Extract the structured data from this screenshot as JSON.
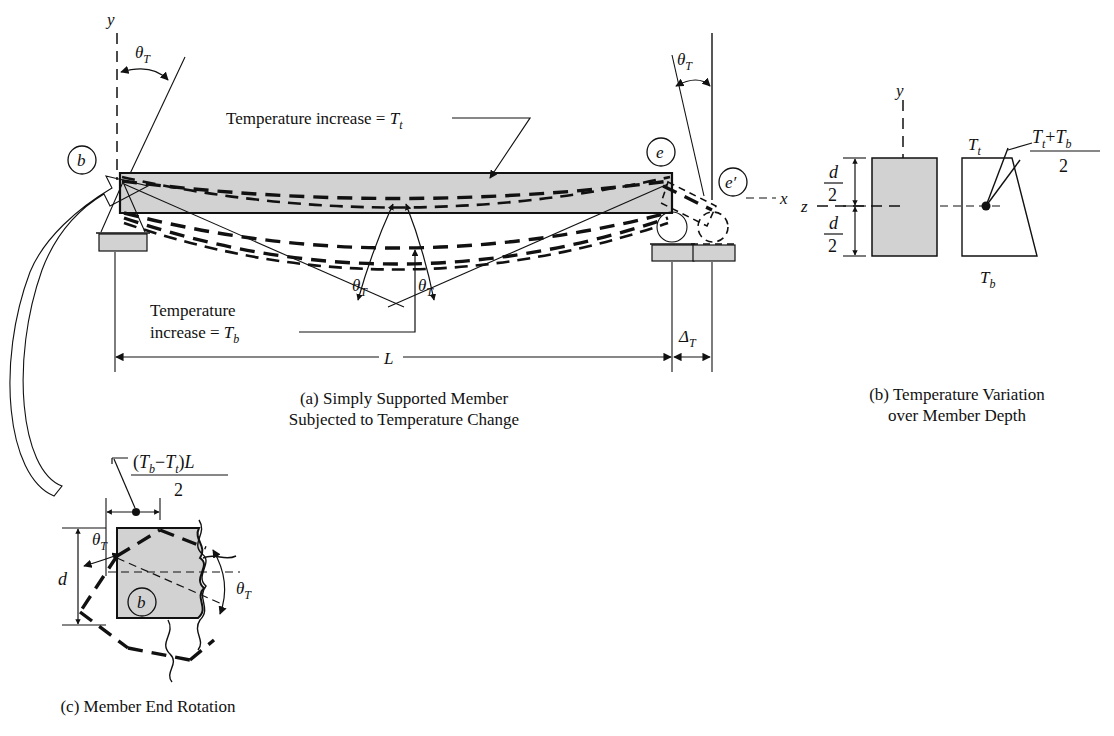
{
  "figure": {
    "title_a": "(a) Simply Supported Member",
    "title_a2": "Subjected to Temperature Change",
    "title_b": "(b) Temperature Variation",
    "title_b2": "over Member Depth",
    "title_c": "(c) Member End Rotation"
  },
  "panel_a": {
    "axis_y": "y",
    "axis_x": "x",
    "node_b": "b",
    "node_e": "e",
    "node_e_prime": "e′",
    "theta_left": "θ",
    "theta_left_sub": "T",
    "theta_right": "θ",
    "theta_right_sub": "T",
    "theta_mid1": "θ",
    "theta_mid1_sub": "T",
    "theta_mid2": "θ",
    "theta_mid2_sub": "T",
    "top_label": "Temperature increase = ",
    "top_label_sym": "T",
    "top_label_sub": "t",
    "bottom_label_line1": "Temperature",
    "bottom_label_line2": "increase = ",
    "bottom_label_sym": "T",
    "bottom_label_sub": "b",
    "span_label": "L",
    "delta_label": "Δ",
    "delta_sub": "T"
  },
  "panel_b": {
    "axis_y": "y",
    "axis_z": "z",
    "depth_num": "d",
    "depth_den": "2",
    "temp_top": "T",
    "temp_top_sub": "t",
    "temp_bottom": "T",
    "temp_bottom_sub": "b",
    "avg_num_a": "T",
    "avg_num_a_sub": "t",
    "avg_plus": "+",
    "avg_num_b": "T",
    "avg_num_b_sub": "b",
    "avg_den": "2"
  },
  "panel_c": {
    "formula_open": "(",
    "formula_tb": "T",
    "formula_tb_sub": "b",
    "formula_minus": "−",
    "formula_tt": "T",
    "formula_tt_sub": "t",
    "formula_close": ")",
    "formula_L": "L",
    "formula_den": "2",
    "depth_label": "d",
    "node_b": "b",
    "theta_upper": "θ",
    "theta_upper_sub": "T",
    "theta_lower": "θ",
    "theta_lower_sub": "T"
  },
  "colors": {
    "ink": "#111111",
    "member_gray": "#d2d2d2",
    "page": "#ffffff"
  }
}
